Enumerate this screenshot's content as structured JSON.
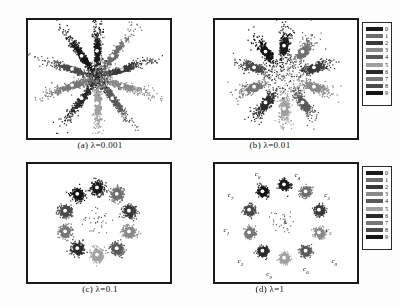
{
  "figure": {
    "background": "#fdfdfd",
    "panel_count": 4
  },
  "panels": [
    {
      "id": "a",
      "caption": "(a)  λ=0.001",
      "lambda": 0.001,
      "has_legend": false,
      "has_cluster_labels": false
    },
    {
      "id": "b",
      "caption": "(b)  λ=0.01",
      "lambda": 0.01,
      "has_legend": true,
      "has_cluster_labels": false
    },
    {
      "id": "c",
      "caption": "(c)  λ=0.1",
      "lambda": 0.1,
      "has_legend": false,
      "has_cluster_labels": false
    },
    {
      "id": "d",
      "caption": "(d)  λ=1",
      "lambda": 1,
      "has_legend": true,
      "has_cluster_labels": true
    }
  ],
  "legend": {
    "title": "",
    "entries": [
      {
        "label": "0",
        "color": "#1b1b1b"
      },
      {
        "label": "1",
        "color": "#6e6e6e"
      },
      {
        "label": "2",
        "color": "#3a3a3a"
      },
      {
        "label": "3",
        "color": "#8a8a8a"
      },
      {
        "label": "4",
        "color": "#5a5a5a"
      },
      {
        "label": "5",
        "color": "#a0a0a0"
      },
      {
        "label": "6",
        "color": "#2b2b2b"
      },
      {
        "label": "7",
        "color": "#777777"
      },
      {
        "label": "8",
        "color": "#4a4a4a"
      },
      {
        "label": "9",
        "color": "#151515"
      }
    ]
  },
  "cluster_labels": [
    {
      "text": "c",
      "sub": "8",
      "x": 0.3,
      "y": 0.09
    },
    {
      "text": "c",
      "sub": "4",
      "x": 0.58,
      "y": 0.1
    },
    {
      "text": "c",
      "sub": "7",
      "x": 0.11,
      "y": 0.27
    },
    {
      "text": "c",
      "sub": "5",
      "x": 0.79,
      "y": 0.27
    },
    {
      "text": "c",
      "sub": "1",
      "x": 0.08,
      "y": 0.57
    },
    {
      "text": "c",
      "sub": "3",
      "x": 0.8,
      "y": 0.57
    },
    {
      "text": "c",
      "sub": "2",
      "x": 0.18,
      "y": 0.83
    },
    {
      "text": "c",
      "sub": "0",
      "x": 0.84,
      "y": 0.83
    },
    {
      "text": "c",
      "sub": "9",
      "x": 0.38,
      "y": 0.94
    },
    {
      "text": "c",
      "sub": "6",
      "x": 0.64,
      "y": 0.9
    }
  ],
  "chart_data": {
    "type": "scatter",
    "title": "",
    "xlabel": "",
    "ylabel": "",
    "xlim": [
      -1,
      1
    ],
    "ylim": [
      -1,
      1
    ],
    "grid": false,
    "legend_position": "right",
    "n_clusters": 10,
    "points_per_cluster": 300,
    "series": [
      {
        "name": "0",
        "color": "#1b1b1b",
        "angle_deg": 0
      },
      {
        "name": "1",
        "color": "#6e6e6e",
        "angle_deg": 36
      },
      {
        "name": "2",
        "color": "#3a3a3a",
        "angle_deg": 72
      },
      {
        "name": "3",
        "color": "#8a8a8a",
        "angle_deg": 108
      },
      {
        "name": "4",
        "color": "#5a5a5a",
        "angle_deg": 144
      },
      {
        "name": "5",
        "color": "#a0a0a0",
        "angle_deg": 180
      },
      {
        "name": "6",
        "color": "#2b2b2b",
        "angle_deg": 216
      },
      {
        "name": "7",
        "color": "#777777",
        "angle_deg": 252
      },
      {
        "name": "8",
        "color": "#4a4a4a",
        "angle_deg": 288
      },
      {
        "name": "9",
        "color": "#151515",
        "angle_deg": 324
      }
    ],
    "panels": [
      {
        "panel": "a",
        "lambda": 0.001,
        "radial_spread": 0.62,
        "tangential_spread": 0.085,
        "radius": 0.5,
        "core_blob": true
      },
      {
        "panel": "b",
        "lambda": 0.01,
        "radial_spread": 0.3,
        "tangential_spread": 0.105,
        "radius": 0.6,
        "core_blob": true
      },
      {
        "panel": "c",
        "lambda": 0.1,
        "radial_spread": 0.13,
        "tangential_spread": 0.115,
        "radius": 0.64,
        "core_blob": true
      },
      {
        "panel": "d",
        "lambda": 1,
        "radial_spread": 0.1,
        "tangential_spread": 0.095,
        "radius": 0.7,
        "core_blob": true
      }
    ]
  }
}
